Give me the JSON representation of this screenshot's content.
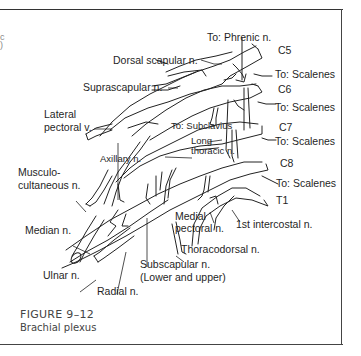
{
  "figure": {
    "number": "FIGURE 9–12",
    "title": "Brachial plexus"
  },
  "roots": [
    {
      "id": "C5",
      "label": "C5"
    },
    {
      "id": "C6",
      "label": "C6"
    },
    {
      "id": "C7",
      "label": "C7"
    },
    {
      "id": "C8",
      "label": "C8"
    },
    {
      "id": "T1",
      "label": "T1"
    }
  ],
  "labels": {
    "phrenic": "To: Phrenic n.",
    "dorsal_scapular": "Dorsal scapular n.",
    "suprascapular": "Suprascapular n.",
    "scalenes_1": "To: Scalenes",
    "scalenes_2": "To: Scalenes",
    "scalenes_3": "To: Scalenes",
    "scalenes_4": "To: Scalenes",
    "lateral_pectoral_1": "Lateral",
    "lateral_pectoral_2": "pectoral v.",
    "subclavius": "To: Subclavius",
    "long_thoracic_1": "Long",
    "long_thoracic_2": "thoracic n.",
    "axillary": "Axillary n.",
    "musculocutaneous_1": "Musculo-",
    "musculocutaneous_2": "cultaneous n.",
    "medial_pectoral_1": "Medial",
    "medial_pectoral_2": "pectoral n.",
    "first_intercostal": "1st intercostal n.",
    "median": "Median n.",
    "thoracodorsal": "Thoracodorsal n.",
    "subscapular_1": "Subscapular n.",
    "subscapular_2": "(Lower and upper)",
    "ulnar": "Ulnar n.",
    "radial": "Radial n."
  }
}
